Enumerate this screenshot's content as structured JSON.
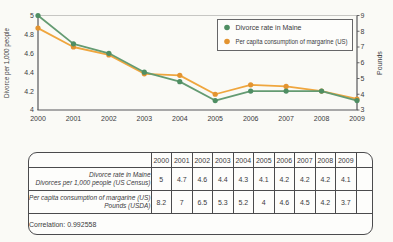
{
  "chart_data": {
    "type": "line",
    "x": [
      2000,
      2001,
      2002,
      2003,
      2004,
      2005,
      2006,
      2007,
      2008,
      2009
    ],
    "series": [
      {
        "name": "Divorce rate in Maine",
        "axis": "left",
        "color": "#649b72",
        "point_color": "#4f8e63",
        "values": [
          5,
          4.7,
          4.6,
          4.4,
          4.3,
          4.1,
          4.2,
          4.2,
          4.2,
          4.1
        ]
      },
      {
        "name": "Per capita consumption of margarine (US)",
        "axis": "right",
        "color": "#efa63e",
        "point_color": "#e39430",
        "values": [
          8.2,
          7,
          6.5,
          5.3,
          5.2,
          4,
          4.6,
          4.5,
          4.2,
          3.7
        ]
      }
    ],
    "left_axis": {
      "label": "Divorce per 1,000 people",
      "min": 4,
      "max": 5,
      "ticks": [
        4,
        4.2,
        4.4,
        4.6,
        4.8,
        5
      ]
    },
    "right_axis": {
      "label": "Pounds",
      "min": 3,
      "max": 9,
      "ticks": [
        3,
        4,
        5,
        6,
        7,
        8,
        9
      ]
    },
    "legend_position": "top-right",
    "grid": "top gridline only",
    "title": ""
  },
  "table": {
    "years": [
      "2000",
      "2001",
      "2002",
      "2003",
      "2004",
      "2005",
      "2006",
      "2007",
      "2008",
      "2009"
    ],
    "rows": [
      {
        "label_lines": [
          "Divorce rate in Maine",
          "Divorces per 1,000 people (US Census)"
        ],
        "values": [
          "5",
          "4.7",
          "4.6",
          "4.4",
          "4.3",
          "4.1",
          "4.2",
          "4.2",
          "4.2",
          "4.1"
        ]
      },
      {
        "label_lines": [
          "Per capita consumption of margarine (US)",
          "Pounds (USDA)"
        ],
        "values": [
          "8.2",
          "7",
          "6.5",
          "5.3",
          "5.2",
          "4",
          "4.6",
          "4.5",
          "4.2",
          "3.7"
        ]
      }
    ],
    "correlation": "Correlation: 0.992558"
  },
  "colors": {
    "background": "#fafaf6",
    "axis": "#57575a",
    "grid": "#c6c6c3",
    "text": "#3b3b3d",
    "table_border": "#4b4b4d",
    "legend_background": "#fdfdfb",
    "divorce_green": "#649b72",
    "margarine_orange": "#efa63e"
  }
}
